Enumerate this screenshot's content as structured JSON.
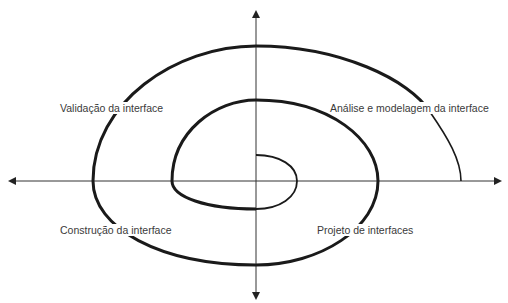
{
  "diagram": {
    "type": "spiral-process",
    "labels": {
      "top_left": "Validação da interface",
      "top_right": "Análise e modelagem da interface",
      "bottom_left": "Construção da interface",
      "bottom_right": "Projeto de interfaces"
    },
    "colors": {
      "background": "#ffffff",
      "spiral": "#1a1a1a",
      "axes": "#333333",
      "label_text": "#3a3a3a"
    }
  }
}
